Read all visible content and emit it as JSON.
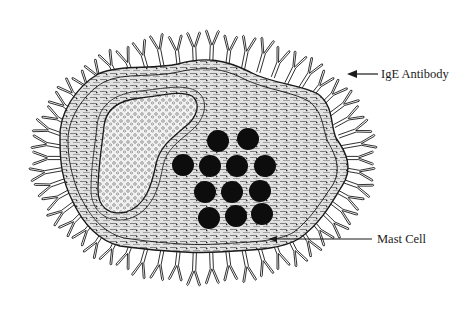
{
  "figure": {
    "labels": {
      "antibody": "IgE Antibody",
      "cell": "Mast Cell"
    },
    "colors": {
      "ink": "#1a1a1a",
      "background": "#ffffff",
      "cytoplasm_fill": "#d9d9d9",
      "nucleus_fill": "#ececec",
      "granule_fill": "#0d0d0d"
    },
    "granules": [
      {
        "cx": 218,
        "cy": 141
      },
      {
        "cx": 248,
        "cy": 139
      },
      {
        "cx": 183,
        "cy": 165
      },
      {
        "cx": 210,
        "cy": 166
      },
      {
        "cx": 237,
        "cy": 166
      },
      {
        "cx": 265,
        "cy": 166
      },
      {
        "cx": 205,
        "cy": 192
      },
      {
        "cx": 232,
        "cy": 192
      },
      {
        "cx": 260,
        "cy": 191
      },
      {
        "cx": 209,
        "cy": 218
      },
      {
        "cx": 236,
        "cy": 216
      },
      {
        "cx": 262,
        "cy": 214
      }
    ],
    "granule_radius": 11
  }
}
